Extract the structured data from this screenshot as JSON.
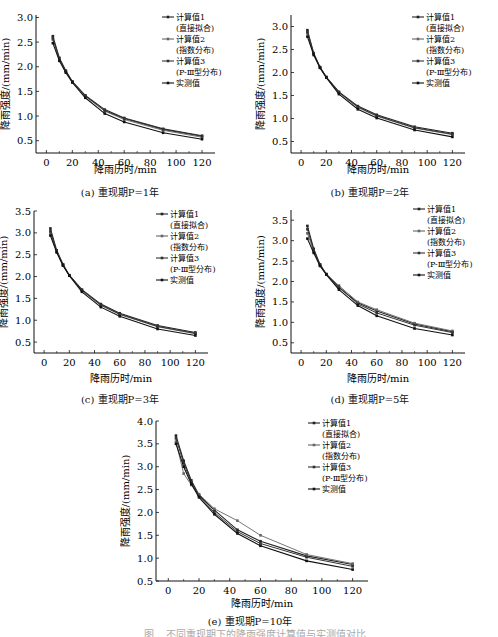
{
  "legend": [
    {
      "label": "计算值1",
      "sub": "(直接拟合)"
    },
    {
      "label": "计算值2",
      "sub": "(指数分布)"
    },
    {
      "label": "计算值3",
      "sub": "(P-Ⅲ型分布)"
    },
    {
      "label": "实测值",
      "sub": ""
    }
  ],
  "axis": {
    "xlabel": "降雨历时/min",
    "ylabel": "降雨强度/(mm/min)"
  },
  "figure_caption_partial": "图... 不同重现期下的降雨强度计算值与实测值对比",
  "chart_data": [
    {
      "type": "line",
      "id": "a",
      "caption": "(a) 重现期P=1年",
      "xlabel": "降雨历时/min",
      "ylabel": "降雨强度/(mm/min)",
      "x": [
        5,
        10,
        15,
        20,
        30,
        45,
        60,
        90,
        120
      ],
      "xticks": [
        0,
        20,
        40,
        60,
        80,
        100,
        120
      ],
      "yticks": [
        0.5,
        1.0,
        1.5,
        2.0,
        2.5,
        3.0
      ],
      "xlim": [
        -8,
        130
      ],
      "ylim": [
        0.25,
        3.05
      ],
      "legend_position": "top-right",
      "grid": false,
      "series": [
        {
          "name": "计算值1(直接拟合)",
          "values": [
            2.62,
            2.18,
            1.92,
            1.7,
            1.42,
            1.13,
            0.96,
            0.74,
            0.6
          ]
        },
        {
          "name": "计算值2(指数分布)",
          "values": [
            2.55,
            2.15,
            1.9,
            1.69,
            1.4,
            1.1,
            0.93,
            0.71,
            0.57
          ]
        },
        {
          "name": "计算值3(P-Ⅲ型分布)",
          "values": [
            2.58,
            2.16,
            1.91,
            1.7,
            1.41,
            1.11,
            0.95,
            0.73,
            0.59
          ]
        },
        {
          "name": "实测值",
          "values": [
            2.48,
            2.12,
            1.88,
            1.68,
            1.37,
            1.05,
            0.88,
            0.66,
            0.53
          ]
        }
      ]
    },
    {
      "type": "line",
      "id": "b",
      "caption": "(b) 重现期P=2年",
      "xlabel": "降雨历时/min",
      "ylabel": "降雨强度/(mm/min)",
      "x": [
        5,
        10,
        15,
        20,
        30,
        45,
        60,
        90,
        120
      ],
      "xticks": [
        0,
        20,
        40,
        60,
        80,
        100,
        120
      ],
      "yticks": [
        0.5,
        1.0,
        1.5,
        2.0,
        2.5,
        3.0
      ],
      "xlim": [
        -8,
        130
      ],
      "ylim": [
        0.25,
        3.25
      ],
      "legend_position": "top-right",
      "grid": false,
      "series": [
        {
          "name": "计算值1(直接拟合)",
          "values": [
            2.92,
            2.42,
            2.12,
            1.9,
            1.58,
            1.27,
            1.08,
            0.82,
            0.68
          ]
        },
        {
          "name": "计算值2(指数分布)",
          "values": [
            2.85,
            2.4,
            2.11,
            1.9,
            1.56,
            1.24,
            1.05,
            0.79,
            0.65
          ]
        },
        {
          "name": "计算值3(P-Ⅲ型分布)",
          "values": [
            2.88,
            2.41,
            2.11,
            1.9,
            1.57,
            1.25,
            1.06,
            0.8,
            0.66
          ]
        },
        {
          "name": "实测值",
          "values": [
            2.78,
            2.38,
            2.1,
            1.89,
            1.53,
            1.2,
            1.01,
            0.75,
            0.6
          ]
        }
      ]
    },
    {
      "type": "line",
      "id": "c",
      "caption": "(c) 重现期P=3年",
      "xlabel": "降雨历时/min",
      "ylabel": "降雨强度/(mm/min)",
      "x": [
        5,
        10,
        15,
        20,
        30,
        45,
        60,
        90,
        120
      ],
      "xticks": [
        0,
        20,
        40,
        60,
        80,
        100,
        120
      ],
      "yticks": [
        0.5,
        1.0,
        1.5,
        2.0,
        2.5,
        3.0,
        3.5
      ],
      "xlim": [
        -8,
        130
      ],
      "ylim": [
        0.25,
        3.5
      ],
      "legend_position": "top-right",
      "grid": false,
      "series": [
        {
          "name": "计算值1(直接拟合)",
          "values": [
            3.1,
            2.6,
            2.28,
            2.03,
            1.7,
            1.37,
            1.16,
            0.88,
            0.72
          ]
        },
        {
          "name": "计算值2(指数分布)",
          "values": [
            3.0,
            2.57,
            2.26,
            2.02,
            1.68,
            1.34,
            1.13,
            0.85,
            0.69
          ]
        },
        {
          "name": "计算值3(P-Ⅲ型分布)",
          "values": [
            3.04,
            2.58,
            2.27,
            2.03,
            1.69,
            1.35,
            1.14,
            0.86,
            0.7
          ]
        },
        {
          "name": "实测值",
          "values": [
            2.94,
            2.55,
            2.25,
            2.02,
            1.65,
            1.3,
            1.09,
            0.8,
            0.65
          ]
        }
      ]
    },
    {
      "type": "line",
      "id": "d",
      "caption": "(d) 重现期P=5年",
      "xlabel": "降雨历时/min",
      "ylabel": "降雨强度/(mm/min)",
      "x": [
        5,
        10,
        15,
        20,
        30,
        45,
        60,
        90,
        120
      ],
      "xticks": [
        0,
        20,
        40,
        60,
        80,
        100,
        120
      ],
      "yticks": [
        0.5,
        1.0,
        1.5,
        2.0,
        2.5,
        3.0,
        3.5
      ],
      "xlim": [
        -8,
        130
      ],
      "ylim": [
        0.25,
        3.75
      ],
      "legend_position": "top-right",
      "grid": false,
      "series": [
        {
          "name": "计算值1(直接拟合)",
          "values": [
            3.36,
            2.8,
            2.42,
            2.18,
            1.85,
            1.48,
            1.28,
            0.96,
            0.77
          ]
        },
        {
          "name": "计算值2(指数分布)",
          "values": [
            3.18,
            2.74,
            2.4,
            2.18,
            1.9,
            1.5,
            1.31,
            0.98,
            0.79
          ]
        },
        {
          "name": "计算值3(P-Ⅲ型分布)",
          "values": [
            3.28,
            2.77,
            2.41,
            2.18,
            1.87,
            1.45,
            1.23,
            0.93,
            0.75
          ]
        },
        {
          "name": "实测值",
          "values": [
            3.05,
            2.7,
            2.38,
            2.17,
            1.8,
            1.41,
            1.16,
            0.85,
            0.69
          ]
        }
      ]
    },
    {
      "type": "line",
      "id": "e",
      "caption": "(e) 重现期P=10年",
      "xlabel": "降雨历时/min",
      "ylabel": "降雨强度/(mm/min)",
      "x": [
        5,
        10,
        15,
        20,
        30,
        45,
        60,
        90,
        120
      ],
      "xticks": [
        0,
        20,
        40,
        60,
        80,
        100,
        120
      ],
      "yticks": [
        0.5,
        1.0,
        1.5,
        2.0,
        2.5,
        3.0,
        3.5,
        4.0
      ],
      "xlim": [
        -8,
        130
      ],
      "ylim": [
        0.5,
        4.0
      ],
      "legend_position": "top-right",
      "grid": false,
      "series": [
        {
          "name": "计算值1(直接拟合)",
          "values": [
            3.68,
            3.13,
            2.7,
            2.38,
            2.05,
            1.62,
            1.37,
            1.05,
            0.86
          ]
        },
        {
          "name": "计算值2(指数分布)",
          "values": [
            3.55,
            2.85,
            2.6,
            2.4,
            2.08,
            1.82,
            1.5,
            1.08,
            0.88
          ]
        },
        {
          "name": "计算值3(P-Ⅲ型分布)",
          "values": [
            3.62,
            3.08,
            2.66,
            2.36,
            2.0,
            1.58,
            1.32,
            1.02,
            0.82
          ]
        },
        {
          "name": "实测值",
          "values": [
            3.5,
            3.0,
            2.62,
            2.33,
            1.96,
            1.54,
            1.27,
            0.94,
            0.75
          ]
        }
      ]
    }
  ]
}
